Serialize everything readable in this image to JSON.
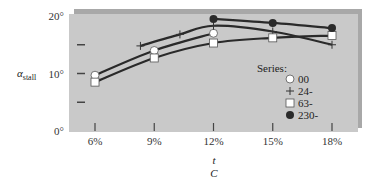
{
  "chart_data": {
    "type": "line",
    "title": "",
    "xlabel_line1": "t",
    "xlabel_line2": "C",
    "ylabel_main": "α",
    "ylabel_sub": "stall",
    "x_ticks": [
      "6%",
      "9%",
      "12%",
      "15%",
      "18%"
    ],
    "x_tick_values": [
      6,
      9,
      12,
      15,
      18
    ],
    "y_ticks": [
      "0°",
      "10°",
      "20°"
    ],
    "y_tick_values": [
      0,
      10,
      20
    ],
    "y_minor_ticks": [
      5,
      15
    ],
    "xlim": [
      4.7,
      19.3
    ],
    "ylim": [
      0,
      20
    ],
    "grid": false,
    "legend_title": "Series:",
    "legend_position": "inside-lower-right",
    "series": [
      {
        "name": "00",
        "marker": "open-circle",
        "x": [
          6,
          9,
          12
        ],
        "y": [
          9.7,
          14.0,
          17.0
        ]
      },
      {
        "name": "24-",
        "marker": "plus",
        "x": [
          8.3,
          10.3,
          12,
          15,
          18
        ],
        "y": [
          14.8,
          16.8,
          18.3,
          17.3,
          15.0
        ]
      },
      {
        "name": "63-",
        "marker": "open-square",
        "x": [
          6,
          9,
          12,
          15,
          18
        ],
        "y": [
          8.5,
          12.7,
          15.3,
          16.2,
          16.6
        ]
      },
      {
        "name": "230-",
        "marker": "filled-circle",
        "x": [
          12,
          15,
          18
        ],
        "y": [
          19.5,
          18.8,
          17.9
        ]
      }
    ]
  },
  "colors": {
    "panel": "#c9c9c9",
    "panel_shadow": "#a8a8a8",
    "line": "#2a2a2a",
    "marker_fill_open": "#ffffff",
    "marker_fill_solid": "#2a2a2a"
  }
}
